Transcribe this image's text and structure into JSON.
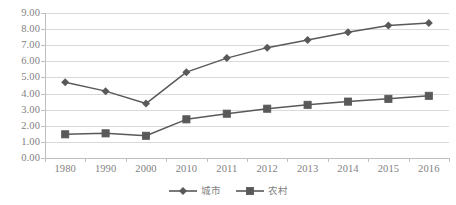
{
  "chart_data": {
    "type": "line",
    "title": "",
    "xlabel": "",
    "ylabel": "",
    "categories": [
      "1980",
      "1990",
      "2000",
      "2010",
      "2011",
      "2012",
      "2013",
      "2014",
      "2015",
      "2016"
    ],
    "series": [
      {
        "name": "城市",
        "marker": "diamond",
        "color": "#595959",
        "values": [
          4.7,
          4.15,
          3.38,
          5.33,
          6.2,
          6.85,
          7.32,
          7.8,
          8.22,
          8.38
        ]
      },
      {
        "name": "农村",
        "marker": "square",
        "color": "#595959",
        "values": [
          1.47,
          1.53,
          1.38,
          2.4,
          2.75,
          3.06,
          3.3,
          3.5,
          3.67,
          3.86
        ]
      }
    ],
    "ylim": [
      0.0,
      9.0
    ],
    "ytick_step": 1.0,
    "ytick_labels": [
      "9.00",
      "8.00",
      "7.00",
      "6.00",
      "5.00",
      "4.00",
      "3.00",
      "2.00",
      "1.00",
      "0.00"
    ],
    "ytick_values": [
      9.0,
      8.0,
      7.0,
      6.0,
      5.0,
      4.0,
      3.0,
      2.0,
      1.0,
      0.0
    ],
    "grid": true,
    "grid_color": "#d9d9d9",
    "legend_position": "bottom"
  },
  "legend": {
    "items": [
      {
        "label": "城市",
        "marker": "diamond"
      },
      {
        "label": "农村",
        "marker": "square"
      }
    ]
  }
}
